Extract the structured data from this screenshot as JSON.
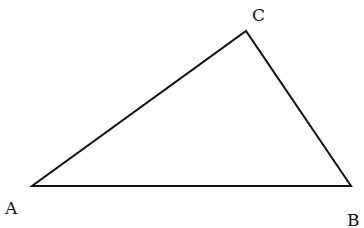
{
  "diagram": {
    "type": "triangle",
    "vertices": {
      "A": {
        "label": "A",
        "x": 32,
        "y": 186
      },
      "B": {
        "label": "B",
        "x": 351,
        "y": 186
      },
      "C": {
        "label": "C",
        "x": 246,
        "y": 31
      }
    },
    "labels": {
      "A": "A",
      "B": "B",
      "C": "C"
    },
    "stroke_color": "#111111"
  }
}
